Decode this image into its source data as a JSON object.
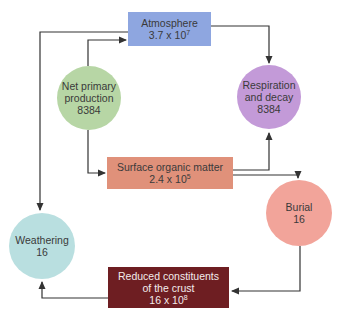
{
  "diagram": {
    "nodes": {
      "atmosphere": {
        "label": "Atmosphere",
        "value_base": "3.7 x 10",
        "value_exp": "7",
        "color": "#8ea6e0",
        "shape": "rectangle"
      },
      "net_primary": {
        "line1": "Net primary",
        "line2": "production",
        "value": "8384",
        "color": "#b7d6a5",
        "shape": "circle"
      },
      "respiration": {
        "line1": "Respiration",
        "line2": "and decay",
        "value": "8384",
        "color": "#c39ad8",
        "shape": "circle"
      },
      "surface_organic": {
        "label": "Surface organic matter",
        "value_base": "2.4 x 10",
        "value_exp": "5",
        "color": "#e0917a",
        "shape": "rectangle"
      },
      "weathering": {
        "label": "Weathering",
        "value": "16",
        "color": "#b9dfe0",
        "shape": "circle"
      },
      "burial": {
        "label": "Burial",
        "value": "16",
        "color": "#f2a49a",
        "shape": "circle"
      },
      "reduced_crust": {
        "line1": "Reduced constituents",
        "line2": "of the crust",
        "value_base": "16 x 10",
        "value_exp": "8",
        "color": "#6e1e22",
        "shape": "rectangle"
      }
    },
    "edges": [
      {
        "from": "net_primary",
        "to": "atmosphere"
      },
      {
        "from": "atmosphere",
        "to": "respiration"
      },
      {
        "from": "net_primary",
        "to": "surface_organic"
      },
      {
        "from": "surface_organic",
        "to": "respiration"
      },
      {
        "from": "surface_organic",
        "to": "burial"
      },
      {
        "from": "burial",
        "to": "reduced_crust"
      },
      {
        "from": "reduced_crust",
        "to": "weathering"
      },
      {
        "from": "atmosphere",
        "to": "weathering"
      }
    ],
    "line_color": "#333333"
  }
}
